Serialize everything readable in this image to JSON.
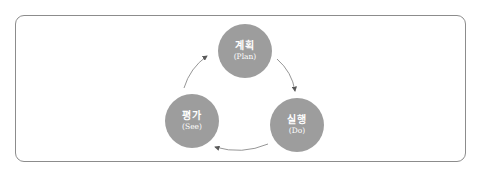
{
  "diagram": {
    "type": "cycle",
    "colors": {
      "node_fill": "#9d9d9d",
      "node_text": "#ffffff",
      "arrow": "#6a6a6a",
      "frame": "#8c8c8c"
    },
    "nodes": [
      {
        "id": "plan",
        "label_ko": "계획",
        "label_en": "(Plan)"
      },
      {
        "id": "do",
        "label_ko": "실행",
        "label_en": "(Do)"
      },
      {
        "id": "see",
        "label_ko": "평가",
        "label_en": "(See)"
      }
    ],
    "edges": [
      {
        "from": "plan",
        "to": "do"
      },
      {
        "from": "do",
        "to": "see"
      },
      {
        "from": "see",
        "to": "plan"
      }
    ]
  }
}
